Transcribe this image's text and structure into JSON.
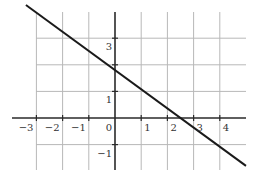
{
  "chart_data": {
    "type": "line",
    "title": "",
    "xlabel": "",
    "ylabel": "",
    "xlim": [
      -3.9,
      5.0
    ],
    "ylim": [
      -2.0,
      4.0
    ],
    "grid": true,
    "x_ticks": [
      -3,
      -2,
      -1,
      0,
      1,
      2,
      3,
      4
    ],
    "y_ticks": [
      -1,
      1,
      3
    ],
    "x_tick_labels": [
      "−3",
      "−2",
      "−1",
      "0",
      "1",
      "2",
      "3",
      "4"
    ],
    "y_tick_labels": [
      "−1",
      "1",
      "3"
    ],
    "grid_x": [
      -3,
      -2,
      -1,
      1,
      2,
      3,
      4
    ],
    "grid_y": [
      -1,
      1,
      2,
      3
    ],
    "series": [
      {
        "name": "line",
        "x": [
          -3.4,
          5.0
        ],
        "y": [
          4.25,
          -1.8
        ],
        "slope": -0.72,
        "intercept": 1.8,
        "color": "#1a1a1a"
      }
    ]
  },
  "colors": {
    "axis": "#2a2a2a",
    "grid": "#b8b8b8",
    "line": "#1a1a1a",
    "label": "#333333"
  }
}
